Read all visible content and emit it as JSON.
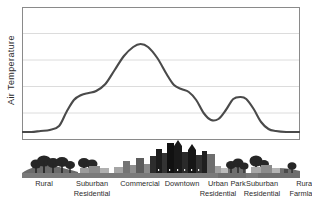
{
  "figure": {
    "title_visible": false,
    "background_color": "#ffffff",
    "border_color": "#8a8a8a",
    "gridline_color": "#d8d8d8",
    "curve_color": "#4a4a4a",
    "text_color": "#2b2b2b"
  },
  "axis": {
    "ylabel": "Air Temperature",
    "y_gridline_count": 4,
    "x_tick_labels": [
      {
        "line1": "Rural",
        "line2": ""
      },
      {
        "line1": "Suburban",
        "line2": "Residential"
      },
      {
        "line1": "Commercial",
        "line2": ""
      },
      {
        "line1": "Downtown",
        "line2": ""
      },
      {
        "line1": "Urban",
        "line2": "Residential"
      },
      {
        "line1": "Park",
        "line2": ""
      },
      {
        "line1": "Suburban",
        "line2": "Residential"
      },
      {
        "line1": "Rural",
        "line2": "Farmland"
      }
    ]
  },
  "chart_data": {
    "type": "line",
    "title": "",
    "xlabel": "",
    "ylabel": "Air Temperature",
    "categories": [
      "Rural",
      "Suburban Residential",
      "Commercial",
      "Downtown",
      "Urban Residential",
      "Park",
      "Suburban Residential",
      "Rural Farmland"
    ],
    "category_x": [
      16,
      45,
      75,
      105,
      135,
      160,
      190,
      222
    ],
    "series": [
      {
        "name": "Air Temperature",
        "values": [
          8,
          22,
          48,
          95,
          52,
          22,
          42,
          9
        ]
      }
    ],
    "points": [
      {
        "x": 0,
        "y": 8
      },
      {
        "x": 10,
        "y": 8
      },
      {
        "x": 20,
        "y": 9
      },
      {
        "x": 30,
        "y": 10
      },
      {
        "x": 40,
        "y": 14
      },
      {
        "x": 48,
        "y": 28
      },
      {
        "x": 56,
        "y": 40
      },
      {
        "x": 64,
        "y": 45
      },
      {
        "x": 72,
        "y": 47
      },
      {
        "x": 80,
        "y": 49
      },
      {
        "x": 90,
        "y": 56
      },
      {
        "x": 100,
        "y": 70
      },
      {
        "x": 110,
        "y": 84
      },
      {
        "x": 120,
        "y": 93
      },
      {
        "x": 128,
        "y": 96
      },
      {
        "x": 136,
        "y": 93
      },
      {
        "x": 146,
        "y": 82
      },
      {
        "x": 156,
        "y": 66
      },
      {
        "x": 164,
        "y": 55
      },
      {
        "x": 172,
        "y": 51
      },
      {
        "x": 180,
        "y": 48
      },
      {
        "x": 188,
        "y": 40
      },
      {
        "x": 196,
        "y": 27
      },
      {
        "x": 204,
        "y": 20
      },
      {
        "x": 212,
        "y": 21
      },
      {
        "x": 220,
        "y": 30
      },
      {
        "x": 228,
        "y": 41
      },
      {
        "x": 236,
        "y": 43
      },
      {
        "x": 242,
        "y": 41
      },
      {
        "x": 250,
        "y": 31
      },
      {
        "x": 258,
        "y": 18
      },
      {
        "x": 266,
        "y": 11
      },
      {
        "x": 274,
        "y": 9
      },
      {
        "x": 285,
        "y": 8
      },
      {
        "x": 300,
        "y": 8
      }
    ],
    "ylim": [
      0,
      133
    ],
    "grid": true,
    "legend": "none",
    "annotations": "Urban heat island profile: temperature rises from rural baseline through suburban and commercial zones, peaks over downtown, dips over the park, rises again over suburban residential, then falls to rural farmland."
  },
  "skyline": {
    "description": "Silhouette of landscape: trees at rural ends, low houses in suburbs, mid-rise commercial blocks, tall dark downtown towers, then park trees and suburbs again.",
    "ground_color": "#5a5a5a",
    "building_colors": [
      "#1a1a1a",
      "#3d3d3d",
      "#6e6e6e",
      "#9a9a9a",
      "#b8b8b8"
    ]
  }
}
